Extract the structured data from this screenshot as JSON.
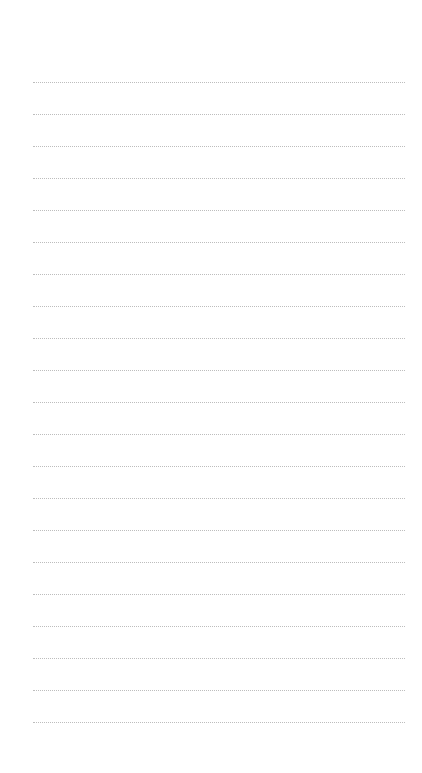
{
  "page": {
    "type": "lined-notepad",
    "line_style": "dotted",
    "line_color": "#bdbdbd",
    "line_count": 21,
    "lines": [
      "",
      "",
      "",
      "",
      "",
      "",
      "",
      "",
      "",
      "",
      "",
      "",
      "",
      "",
      "",
      "",
      "",
      "",
      "",
      "",
      ""
    ]
  }
}
